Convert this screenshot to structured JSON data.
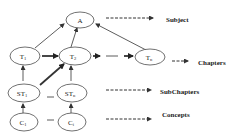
{
  "diagram": {
    "nodes": {
      "A": {
        "label": "A",
        "sub": ""
      },
      "T1": {
        "label": "T",
        "sub": "1"
      },
      "T2": {
        "label": "T",
        "sub": "2"
      },
      "Tn": {
        "label": "T",
        "sub": "n"
      },
      "ST1": {
        "label": "ST",
        "sub": "1"
      },
      "STn": {
        "label": "ST",
        "sub": "n"
      },
      "C1": {
        "label": "C",
        "sub": "1"
      },
      "Ci": {
        "label": "C",
        "sub": "i"
      }
    },
    "legend": {
      "subject": "Subject",
      "chapters": "Chapters",
      "subchapters": "SubChapters",
      "concepts": "Concepts"
    },
    "colors": {
      "stroke": "#333333",
      "background": "#ffffff"
    }
  }
}
